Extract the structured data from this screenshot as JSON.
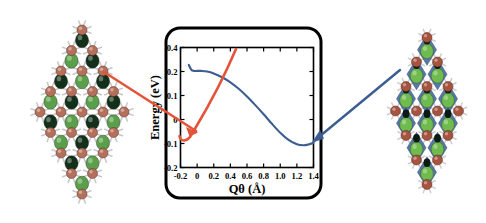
{
  "figure": {
    "name": "energy-vs-distortion-coordinate-toc-graphic",
    "background": "#ffffff"
  },
  "panel": {
    "border_color": "#000000",
    "border_radius": 14,
    "fill": "#ffffff"
  },
  "left_structure": {
    "name": "undistorted-lattice-structure",
    "shape": "rhombus",
    "atom_colors": {
      "metal": "#b5705c",
      "anion_light": "#5aa04a",
      "anion_dark": "#13301a",
      "bond": "#c9c9c9"
    },
    "polyhedra": "none"
  },
  "right_structure": {
    "name": "distorted-octahedra-structure",
    "shape": "rhombus",
    "atom_colors": {
      "metal": "#a6533f",
      "anion_light": "#6fbb4e",
      "anion_dark": "#0d1a10",
      "bond": "#cfcfcf",
      "polyhedron": "#4a6c9e"
    },
    "polyhedra": "blue-octahedra"
  },
  "arrows": {
    "left": {
      "name": "red-arrow-left-structure-to-curve",
      "color": "#e2553a",
      "from": "left structure",
      "to": "energy curve near Q=0.1"
    },
    "right": {
      "name": "blue-arrow-right-structure-to-minimum",
      "color": "#3c5d91",
      "from": "right structure",
      "to": "energy curve minimum near Q=1.25"
    },
    "red_overlay": {
      "name": "red-arrow-curve-segment",
      "color": "#e2553a"
    }
  },
  "chart_data": {
    "type": "line",
    "title": "",
    "xlabel": "Qθ (Å)",
    "ylabel": "Energy (eV)",
    "xlim": [
      -0.2,
      1.4
    ],
    "ylim": [
      -0.2,
      0.4
    ],
    "grid": false,
    "legend": "none",
    "xticks": [
      -0.2,
      0,
      0.2,
      0.4,
      0.6,
      0.8,
      1.0,
      1.2,
      1.4
    ],
    "xticklabels": [
      "-0.2",
      "0",
      "0.2",
      "0.4",
      "0.6",
      "0.8",
      "1.0",
      "1.2",
      "1.4"
    ],
    "yticks": [
      0.4,
      0.2,
      0.1,
      0,
      -0.1,
      -0.2
    ],
    "yticklabels": [
      "0.4",
      "0.2",
      "0.1",
      "0",
      "-0.1",
      "-0.2"
    ],
    "series": [
      {
        "name": "energy-profile",
        "color": "#3c5d91",
        "x": [
          -0.1,
          -0.07,
          -0.04,
          0.0,
          0.05,
          0.12,
          0.2,
          0.3,
          0.4,
          0.5,
          0.6,
          0.7,
          0.8,
          0.9,
          1.0,
          1.1,
          1.2,
          1.28,
          1.34,
          1.4
        ],
        "y": [
          0.255,
          0.215,
          0.205,
          0.205,
          0.205,
          0.2,
          0.192,
          0.176,
          0.155,
          0.128,
          0.096,
          0.06,
          0.022,
          -0.018,
          -0.055,
          -0.085,
          -0.103,
          -0.107,
          -0.104,
          -0.098
        ]
      }
    ],
    "annotations": [
      {
        "name": "red-arrow-annotation",
        "color": "#e2553a",
        "points_to_x": 0.07,
        "points_to_y": 0.02
      },
      {
        "name": "blue-arrow-annotation",
        "color": "#3c5d91",
        "points_to_x": 1.25,
        "points_to_y": -0.105
      }
    ]
  }
}
